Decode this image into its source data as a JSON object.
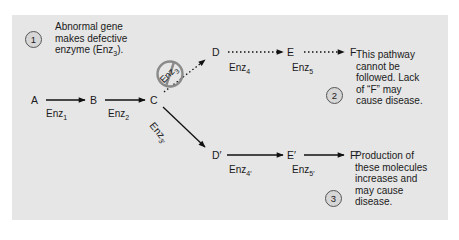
{
  "diagram": {
    "colors": {
      "panel": "#e6e6e6",
      "text": "#1a1a1a",
      "inhibit_symbol": "#8a8a8a"
    },
    "notes": [
      {
        "number": "1",
        "lines": [
          "Abnormal gene",
          "makes defective",
          "enzyme (Enz"
        ],
        "sub": "3",
        "tail": ")."
      },
      {
        "number": "2",
        "lines": [
          "This pathway",
          "cannot be",
          "followed. Lack",
          "of “F” may",
          "cause disease."
        ]
      },
      {
        "number": "3",
        "lines": [
          "Production of",
          "these molecules",
          "increases and",
          "may cause",
          "disease."
        ]
      }
    ],
    "nodes": {
      "A": "A",
      "B": "B",
      "C": "C",
      "D": "D",
      "E": "E",
      "F": "F",
      "D_prime": "D′",
      "E_prime": "E′",
      "F_prime": "F′"
    },
    "enzymes": {
      "enz1": {
        "base": "Enz",
        "sub": "1"
      },
      "enz2": {
        "base": "Enz",
        "sub": "2"
      },
      "enz3": {
        "base": "Enz",
        "sub": "3"
      },
      "enz3p": {
        "base": "Enz",
        "sub": "3′"
      },
      "enz4": {
        "base": "Enz",
        "sub": "4"
      },
      "enz5": {
        "base": "Enz",
        "sub": "5"
      },
      "enz4p": {
        "base": "Enz",
        "sub": "4′"
      },
      "enz5p": {
        "base": "Enz",
        "sub": "5′"
      }
    },
    "edges": [
      {
        "from": "A",
        "to": "B",
        "enzyme": "enz1",
        "style": "solid"
      },
      {
        "from": "B",
        "to": "C",
        "enzyme": "enz2",
        "style": "solid"
      },
      {
        "from": "C",
        "to": "D",
        "enzyme": "enz3",
        "style": "dotted",
        "blocked": true
      },
      {
        "from": "D",
        "to": "E",
        "enzyme": "enz4",
        "style": "dotted"
      },
      {
        "from": "E",
        "to": "F",
        "enzyme": "enz5",
        "style": "dotted"
      },
      {
        "from": "C",
        "to": "D_prime",
        "enzyme": "enz3p",
        "style": "solid"
      },
      {
        "from": "D_prime",
        "to": "E_prime",
        "enzyme": "enz4p",
        "style": "solid"
      },
      {
        "from": "E_prime",
        "to": "F_prime",
        "enzyme": "enz5p",
        "style": "solid"
      }
    ]
  }
}
